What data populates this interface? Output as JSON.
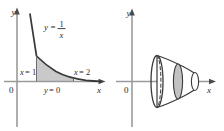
{
  "figure": {
    "panel_count": 2,
    "background_color": "#ffffff",
    "axis_color": "#8c8c8c",
    "curve_color": "#3a3a3a",
    "shade_color": "#c9c9c9",
    "label_color": "#2b2b2b"
  },
  "left_panel": {
    "name": "region-plot",
    "axes": {
      "y_axis_label": "y",
      "x_axis_label": "x",
      "origin_label": "0"
    },
    "curve": {
      "label_y": "y",
      "label_equals": "=",
      "label_numerator": "1",
      "label_denominator": "x",
      "label_full": "y = 1/x"
    },
    "boundaries": [
      {
        "name": "left-bound",
        "label_var": "x",
        "label_eq": "=",
        "label_value": "1",
        "label_full": "x = 1"
      },
      {
        "name": "right-bound",
        "label_var": "x",
        "label_eq": "=",
        "label_value": "2",
        "label_full": "x = 2"
      },
      {
        "name": "lower-bound",
        "label_var": "y",
        "label_eq": "=",
        "label_value": "0",
        "label_full": "y = 0"
      }
    ]
  },
  "right_panel": {
    "name": "solid-of-revolution-plot",
    "axes": {
      "y_axis_label": "y",
      "x_axis_label": "x",
      "origin_label": "0"
    },
    "solid": {
      "description": "horn-shaped solid of revolution",
      "left_face": "large ellipse",
      "hidden_edge": "dashed ellipse",
      "cross_section": "shaded representative disk",
      "right_face": "small ellipse"
    }
  }
}
